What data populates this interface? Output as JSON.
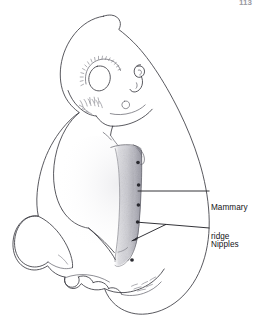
{
  "figure": {
    "kind": "anatomical-line-drawing",
    "page_number": "113",
    "colors": {
      "background": "#ffffff",
      "ink": "#3b3b42",
      "leader_line": "#1d1d22",
      "label_text": "#141418",
      "nipple_dot": "#2a2a30",
      "ridge_shading": "#9b9ba3"
    }
  },
  "labels": [
    {
      "id": "mammary-ridge",
      "line1": "Mammary",
      "line2": "ridge",
      "full_text": "Mammary ridge",
      "leader": {
        "from_x": 209,
        "from_y": 191,
        "to_x": 137,
        "to_y": 191
      }
    },
    {
      "id": "nipples",
      "line1": "Nipples",
      "line2": "",
      "full_text": "Nipples",
      "leader": {
        "from_x": 209,
        "from_y": 228,
        "to_x": 137,
        "to_y": 222
      }
    }
  ],
  "structures": {
    "head_label": "head",
    "eye_label": "eye",
    "ear_label": "otic vesicle",
    "forelimb_label": "forelimb bud",
    "hindlimb_label": "hindlimb bud",
    "tail_label": "tail",
    "ridge_label": "mammary ridge",
    "nipple_label": "nipple"
  },
  "nipples": {
    "count": 5,
    "points": [
      {
        "x": 138.0,
        "y": 162.5
      },
      {
        "x": 138.6,
        "y": 185.0
      },
      {
        "x": 138.4,
        "y": 205.0
      },
      {
        "x": 137.6,
        "y": 222.0
      },
      {
        "x": 132.0,
        "y": 260.0
      }
    ]
  }
}
